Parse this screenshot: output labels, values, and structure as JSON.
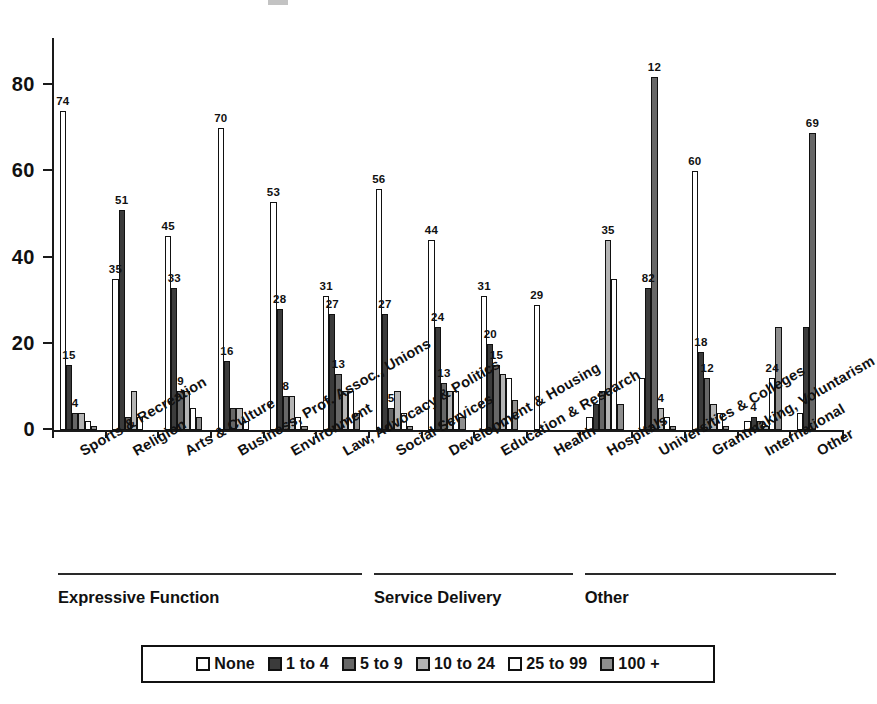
{
  "chart_data": {
    "type": "bar",
    "title": "",
    "xlabel": "",
    "ylabel": "",
    "ylim": [
      0,
      90
    ],
    "yticks": [
      0,
      20,
      40,
      60,
      80
    ],
    "ytick_labels": [
      "0",
      "20",
      "40",
      "60",
      "80"
    ],
    "grid": false,
    "legend_position": "bottom",
    "categories": [
      "Sports & Recreation",
      "Religion",
      "Arts & Culture",
      "Business, Prof. Assoc., Unions",
      "Environment",
      "Law, Advocacy & Politics",
      "Social Services",
      "Development & Housing",
      "Education & Research",
      "Health",
      "Hospitals",
      "Universities & Colleges",
      "Grantmaking, Voluntarism",
      "International",
      "Other"
    ],
    "series": [
      {
        "name": "None",
        "color": "#ffffff",
        "values": [
          74,
          35,
          45,
          70,
          53,
          31,
          56,
          44,
          31,
          29,
          3,
          12,
          60,
          2,
          4
        ]
      },
      {
        "name": "1 to 4",
        "color": "#3b3b3b",
        "values": [
          15,
          51,
          33,
          16,
          28,
          27,
          27,
          24,
          20,
          0,
          6,
          33,
          18,
          3,
          24
        ]
      },
      {
        "name": "5 to 9",
        "color": "#676767",
        "values": [
          4,
          3,
          9,
          5,
          8,
          13,
          5,
          11,
          15,
          0,
          9,
          82,
          12,
          2,
          69
        ]
      },
      {
        "name": "10 to 24",
        "color": "#b4b4b4",
        "values": [
          4,
          9,
          9,
          5,
          8,
          9,
          9,
          9,
          13,
          0,
          44,
          5,
          6,
          1,
          0
        ]
      },
      {
        "name": "25 to 99",
        "color": "#ffffff",
        "values": [
          2,
          3,
          5,
          2,
          3,
          9,
          4,
          9,
          12,
          0,
          35,
          3,
          4,
          12,
          0
        ]
      },
      {
        "name": "100 +",
        "color": "#8e8e8e",
        "values": [
          1,
          0,
          3,
          0,
          1,
          4,
          1,
          3,
          7,
          0,
          6,
          1,
          1,
          24,
          0
        ]
      }
    ],
    "bar_labels": [
      {
        "group": 0,
        "series": 0,
        "text": "74"
      },
      {
        "group": 0,
        "series": 1,
        "text": "15"
      },
      {
        "group": 0,
        "series": 2,
        "text": "4"
      },
      {
        "group": 1,
        "series": 0,
        "text": "35"
      },
      {
        "group": 1,
        "series": 1,
        "text": "51"
      },
      {
        "group": 2,
        "series": 0,
        "text": "45"
      },
      {
        "group": 2,
        "series": 1,
        "text": "33"
      },
      {
        "group": 2,
        "series": 2,
        "text": "9"
      },
      {
        "group": 3,
        "series": 0,
        "text": "70"
      },
      {
        "group": 3,
        "series": 1,
        "text": "16"
      },
      {
        "group": 4,
        "series": 0,
        "text": "53"
      },
      {
        "group": 4,
        "series": 1,
        "text": "28"
      },
      {
        "group": 4,
        "series": 2,
        "text": "8"
      },
      {
        "group": 5,
        "series": 0,
        "text": "31"
      },
      {
        "group": 5,
        "series": 1,
        "text": "27"
      },
      {
        "group": 5,
        "series": 2,
        "text": "13"
      },
      {
        "group": 6,
        "series": 0,
        "text": "56"
      },
      {
        "group": 6,
        "series": 1,
        "text": "27"
      },
      {
        "group": 6,
        "series": 2,
        "text": "5"
      },
      {
        "group": 7,
        "series": 0,
        "text": "44"
      },
      {
        "group": 7,
        "series": 1,
        "text": "24"
      },
      {
        "group": 7,
        "series": 2,
        "text": "13"
      },
      {
        "group": 8,
        "series": 0,
        "text": "31"
      },
      {
        "group": 8,
        "series": 1,
        "text": "20"
      },
      {
        "group": 8,
        "series": 2,
        "text": "15"
      },
      {
        "group": 9,
        "series": 0,
        "text": "29"
      },
      {
        "group": 10,
        "series": 3,
        "text": "35"
      },
      {
        "group": 11,
        "series": 1,
        "text": "82"
      },
      {
        "group": 11,
        "series": 2,
        "text": "12"
      },
      {
        "group": 11,
        "series": 3,
        "text": "4"
      },
      {
        "group": 12,
        "series": 0,
        "text": "60"
      },
      {
        "group": 12,
        "series": 1,
        "text": "18"
      },
      {
        "group": 12,
        "series": 2,
        "text": "12"
      },
      {
        "group": 13,
        "series": 1,
        "text": "4"
      },
      {
        "group": 13,
        "series": 4,
        "text": "24"
      },
      {
        "group": 14,
        "series": 2,
        "text": "69"
      }
    ]
  },
  "group_brackets": [
    {
      "label": "Expressive Function",
      "start_category": 0,
      "end_category": 5
    },
    {
      "label": "Service Delivery",
      "start_category": 6,
      "end_category": 9
    },
    {
      "label": "Other",
      "start_category": 10,
      "end_category": 14
    }
  ],
  "legend": {
    "items": [
      {
        "label": "None",
        "color": "#ffffff"
      },
      {
        "label": "1 to 4",
        "color": "#3b3b3b"
      },
      {
        "label": "5 to 9",
        "color": "#676767"
      },
      {
        "label": "10 to 24",
        "color": "#b4b4b4"
      },
      {
        "label": "25 to 99",
        "color": "#ffffff"
      },
      {
        "label": "100 +",
        "color": "#8e8e8e"
      }
    ]
  }
}
